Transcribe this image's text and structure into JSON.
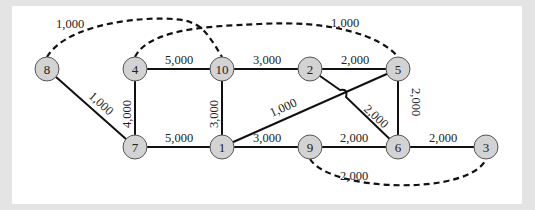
{
  "diagram": {
    "type": "network-graph",
    "colors": {
      "background": "#e4e4e4",
      "panel": "#ffffff",
      "node_fill": "#d3d3d3",
      "node_stroke": "#555555",
      "edge": "#111111"
    },
    "nodes": [
      {
        "id": "8",
        "label": "8"
      },
      {
        "id": "4",
        "label": "4"
      },
      {
        "id": "10",
        "label": "10"
      },
      {
        "id": "2",
        "label": "2"
      },
      {
        "id": "5",
        "label": "5"
      },
      {
        "id": "7",
        "label": "7"
      },
      {
        "id": "1",
        "label": "1"
      },
      {
        "id": "9",
        "label": "9"
      },
      {
        "id": "6",
        "label": "6"
      },
      {
        "id": "3",
        "label": "3"
      }
    ],
    "solid_edges": [
      {
        "from": "4",
        "to": "10",
        "label": "5,000"
      },
      {
        "from": "10",
        "to": "2",
        "label": "3,000"
      },
      {
        "from": "2",
        "to": "5",
        "label": "2,000"
      },
      {
        "from": "8",
        "to": "7",
        "label": "1,000"
      },
      {
        "from": "4",
        "to": "7",
        "label": "4,000"
      },
      {
        "from": "10",
        "to": "1",
        "label": "3,000"
      },
      {
        "from": "1",
        "to": "5",
        "label": "1,000"
      },
      {
        "from": "2",
        "to": "6",
        "label": "2,000"
      },
      {
        "from": "5",
        "to": "6",
        "label": "2,000"
      },
      {
        "from": "7",
        "to": "1",
        "label": "5,000"
      },
      {
        "from": "1",
        "to": "9",
        "label": "3,000"
      },
      {
        "from": "9",
        "to": "6",
        "label": "2,000"
      },
      {
        "from": "6",
        "to": "3",
        "label": "2,000"
      }
    ],
    "dashed_edges": [
      {
        "from": "8",
        "to": "10",
        "label": "1,000"
      },
      {
        "from": "4",
        "to": "5",
        "label": "1,000"
      },
      {
        "from": "9",
        "to": "3",
        "label": "2,000"
      }
    ]
  }
}
